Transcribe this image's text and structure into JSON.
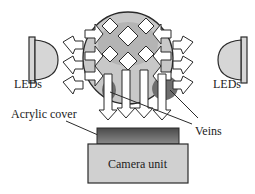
{
  "labels": {
    "leds_left": "LEDs",
    "leds_right": "LEDs",
    "acrylic_cover": "Acrylic cover",
    "veins": "Veins",
    "camera_unit": "Camera unit"
  },
  "colors": {
    "finger_fill": "#c8c8c8",
    "finger_inner": "#b4b4b4",
    "vein_fill": "#6e6e6e",
    "led_fill": "#d6d6d6",
    "acrylic_fill": "#6a6a6a",
    "camera_fill": "#d0d0d0",
    "outline": "#2a2a2a"
  }
}
